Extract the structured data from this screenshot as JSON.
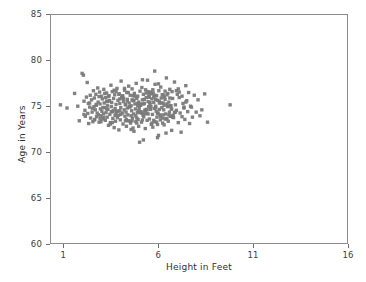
{
  "chart_data": {
    "type": "scatter",
    "title": "",
    "xlabel": "Height in Feet",
    "ylabel": "Age in Years",
    "xlim": [
      0.3,
      16.0
    ],
    "ylim": [
      60,
      85
    ],
    "xticks": [
      1,
      6,
      11,
      16
    ],
    "xticklabels": [
      "1",
      "6",
      "11",
      "16"
    ],
    "yticks": [
      60,
      65,
      70,
      75,
      80,
      85
    ],
    "yticklabels": [
      "60",
      "65",
      "70",
      "75",
      "80",
      "85"
    ],
    "grid": false,
    "legend": null,
    "marker": {
      "shape": "square",
      "color": "#7a7a7a",
      "size_px": 1.7,
      "opacity": 0.95
    },
    "series": [
      {
        "name": "observations",
        "n_points": 333,
        "x": [
          0.8,
          1.15,
          1.55,
          1.72,
          1.8,
          1.95,
          2.02,
          2.05,
          2.1,
          2.12,
          2.18,
          2.22,
          2.25,
          2.28,
          2.3,
          2.35,
          2.38,
          2.4,
          2.45,
          2.48,
          2.52,
          2.55,
          2.58,
          2.6,
          2.62,
          2.65,
          2.68,
          2.7,
          2.72,
          2.75,
          2.78,
          2.8,
          2.82,
          2.85,
          2.88,
          2.9,
          2.92,
          2.95,
          2.98,
          3.0,
          3.02,
          3.05,
          3.08,
          3.1,
          3.12,
          3.15,
          3.18,
          3.2,
          3.22,
          3.25,
          3.28,
          3.3,
          3.32,
          3.35,
          3.38,
          3.4,
          3.42,
          3.45,
          3.48,
          3.5,
          3.52,
          3.55,
          3.58,
          3.6,
          3.62,
          3.65,
          3.68,
          3.7,
          3.72,
          3.75,
          3.78,
          3.8,
          3.82,
          3.85,
          3.88,
          3.9,
          3.92,
          3.95,
          3.98,
          4.0,
          4.02,
          4.05,
          4.08,
          4.1,
          4.12,
          4.15,
          4.18,
          4.2,
          4.22,
          4.25,
          4.28,
          4.3,
          4.32,
          4.35,
          4.38,
          4.4,
          4.42,
          4.45,
          4.48,
          4.5,
          4.52,
          4.55,
          4.58,
          4.6,
          4.62,
          4.65,
          4.68,
          4.7,
          4.72,
          4.75,
          4.78,
          4.8,
          4.82,
          4.85,
          4.88,
          4.9,
          4.92,
          4.95,
          4.98,
          5.0,
          5.02,
          5.05,
          5.08,
          5.1,
          5.12,
          5.15,
          5.18,
          5.2,
          5.22,
          5.25,
          5.28,
          5.3,
          5.32,
          5.35,
          5.38,
          5.4,
          5.42,
          5.45,
          5.48,
          5.5,
          5.52,
          5.55,
          5.58,
          5.6,
          5.62,
          5.65,
          5.68,
          5.7,
          5.72,
          5.75,
          5.78,
          5.8,
          5.82,
          5.85,
          5.88,
          5.9,
          5.92,
          5.95,
          5.98,
          6.0,
          6.02,
          6.05,
          6.08,
          6.1,
          6.12,
          6.15,
          6.18,
          6.2,
          6.22,
          6.25,
          6.28,
          6.3,
          6.32,
          6.35,
          6.38,
          6.4,
          6.42,
          6.45,
          6.48,
          6.5,
          6.52,
          6.55,
          6.58,
          6.6,
          6.62,
          6.65,
          6.68,
          6.7,
          6.72,
          6.75,
          6.78,
          6.8,
          6.85,
          6.9,
          6.95,
          7.0,
          7.05,
          7.1,
          7.15,
          7.2,
          7.25,
          7.3,
          7.35,
          7.4,
          7.45,
          7.5,
          7.55,
          7.6,
          7.65,
          7.7,
          7.75,
          7.8,
          7.9,
          8.0,
          8.1,
          8.2,
          8.3,
          8.45,
          8.6,
          9.8,
          2.05,
          2.35,
          2.6,
          2.85,
          3.05,
          3.25,
          3.45,
          3.65,
          3.85,
          4.05,
          4.25,
          4.45,
          4.65,
          4.85,
          5.05,
          5.25,
          5.45,
          5.65,
          5.85,
          6.05,
          6.25,
          6.45,
          6.65,
          6.85,
          7.05,
          7.25,
          7.45,
          2.5,
          2.95,
          3.35,
          3.75,
          4.15,
          4.55,
          4.95,
          5.35,
          5.75,
          6.15,
          6.55,
          6.95,
          7.35,
          2.7,
          3.1,
          3.5,
          3.9,
          4.3,
          4.7,
          5.1,
          5.5,
          5.9,
          6.3,
          6.7,
          7.1,
          2.9,
          3.3,
          3.7,
          4.1,
          4.5,
          4.9,
          5.3,
          5.7,
          6.1,
          6.5,
          6.9,
          3.15,
          3.55,
          3.95,
          4.35,
          4.75,
          5.15,
          5.55,
          5.95,
          6.35,
          6.75,
          3.4,
          3.8,
          4.2,
          4.6,
          5.0,
          5.4,
          5.8,
          6.2,
          6.6,
          4.0,
          4.4,
          4.8,
          5.2,
          5.6,
          6.0,
          6.4,
          4.6,
          5.05,
          5.5,
          5.95,
          4.9,
          5.35,
          5.8,
          5.2,
          5.65,
          5.45,
          4.35,
          4.95,
          5.75,
          6.35,
          3.95,
          5.15,
          6.05,
          4.55,
          5.85,
          3.75,
          6.65,
          4.25,
          5.95,
          3.55,
          6.45,
          4.85,
          5.25,
          6.25,
          4.65,
          5.55,
          3.25
        ],
        "y": [
          75.15,
          74.8,
          76.4,
          75.0,
          73.4,
          78.6,
          78.4,
          75.55,
          74.55,
          73.9,
          76.0,
          77.6,
          74.2,
          75.3,
          73.1,
          74.9,
          76.2,
          73.7,
          75.7,
          74.35,
          73.3,
          76.7,
          74.95,
          75.9,
          73.55,
          74.6,
          76.3,
          75.1,
          73.85,
          74.25,
          77.0,
          75.45,
          74.05,
          73.25,
          76.55,
          75.25,
          74.7,
          73.95,
          76.1,
          74.45,
          75.8,
          73.6,
          74.15,
          76.85,
          75.35,
          74.85,
          73.45,
          75.95,
          74.3,
          76.45,
          73.8,
          75.05,
          74.65,
          72.9,
          76.15,
          75.6,
          74.1,
          73.2,
          77.3,
          74.95,
          75.4,
          76.6,
          73.65,
          74.5,
          75.85,
          72.65,
          76.25,
          74.75,
          73.35,
          75.2,
          74.4,
          76.95,
          73.75,
          75.65,
          74.0,
          72.4,
          76.35,
          75.3,
          73.5,
          74.85,
          77.75,
          75.95,
          74.25,
          76.05,
          73.05,
          75.5,
          74.6,
          76.75,
          73.9,
          75.15,
          74.35,
          72.8,
          76.5,
          75.75,
          74.05,
          73.4,
          77.2,
          75.35,
          74.9,
          76.2,
          73.15,
          75.05,
          74.5,
          76.9,
          73.7,
          75.6,
          74.15,
          72.25,
          76.4,
          75.25,
          74.7,
          73.95,
          77.5,
          75.85,
          74.3,
          76.1,
          73.55,
          75.45,
          74.8,
          71.05,
          76.65,
          75.1,
          74.4,
          73.25,
          77.05,
          75.7,
          74.0,
          76.3,
          73.85,
          75.3,
          74.55,
          72.55,
          76.8,
          75.95,
          74.2,
          73.45,
          77.85,
          75.5,
          74.95,
          76.0,
          73.6,
          75.2,
          74.65,
          76.55,
          73.0,
          75.8,
          74.1,
          72.7,
          76.45,
          75.4,
          74.75,
          73.3,
          77.4,
          75.0,
          74.45,
          76.15,
          73.8,
          75.65,
          74.25,
          71.8,
          76.7,
          75.55,
          74.05,
          73.5,
          77.1,
          75.9,
          74.85,
          76.25,
          73.15,
          75.35,
          74.6,
          72.95,
          76.0,
          75.75,
          74.15,
          73.65,
          78.1,
          75.25,
          74.95,
          76.4,
          73.35,
          75.45,
          74.35,
          76.85,
          73.9,
          75.05,
          74.7,
          72.35,
          76.6,
          75.85,
          74.0,
          73.75,
          77.65,
          75.15,
          74.55,
          76.3,
          73.2,
          75.95,
          74.25,
          72.15,
          76.1,
          75.3,
          74.8,
          73.55,
          77.25,
          75.6,
          74.4,
          76.5,
          73.1,
          75.0,
          74.9,
          73.8,
          76.2,
          74.35,
          75.7,
          73.95,
          74.6,
          76.35,
          73.25,
          75.15,
          74.1,
          75.35,
          73.5,
          76.05,
          74.85,
          75.55,
          73.05,
          76.75,
          74.45,
          75.9,
          73.4,
          74.95,
          76.15,
          73.7,
          75.25,
          74.2,
          76.6,
          73.15,
          75.75,
          74.65,
          76.25,
          73.6,
          75.05,
          74.3,
          76.9,
          73.85,
          75.45,
          74.75,
          73.3,
          76.05,
          74.15,
          75.85,
          73.95,
          74.5,
          76.45,
          73.45,
          75.35,
          74.05,
          76.7,
          74.9,
          75.2,
          73.75,
          74.4,
          76.3,
          73.55,
          75.65,
          74.25,
          76.0,
          73.25,
          75.1,
          74.7,
          76.55,
          73.65,
          75.5,
          74.0,
          76.15,
          73.35,
          75.3,
          74.55,
          76.8,
          73.9,
          75.0,
          74.35,
          76.4,
          73.2,
          75.8,
          74.8,
          76.1,
          73.5,
          75.4,
          74.2,
          76.65,
          73.8,
          75.6,
          74.45,
          76.95,
          73.4,
          75.15,
          74.6,
          76.2,
          73.7,
          75.9,
          74.1,
          76.5,
          73.3,
          75.25,
          74.95,
          77.45,
          72.05,
          75.7,
          74.3,
          76.3,
          73.0,
          75.05,
          74.65,
          78.85,
          71.3,
          76.35,
          74.15,
          75.55,
          72.8,
          76.0,
          73.6,
          74.5,
          77.9,
          75.35,
          72.45,
          74.85,
          76.6,
          73.9,
          75.2,
          71.55,
          74.4,
          76.25,
          73.15,
          75.75,
          74.05,
          72.6,
          76.45,
          74.7
        ],
        "color": "#7a7a7a"
      }
    ]
  },
  "axis": {
    "x_title": "Height in Feet",
    "y_title": "Age in Years"
  }
}
